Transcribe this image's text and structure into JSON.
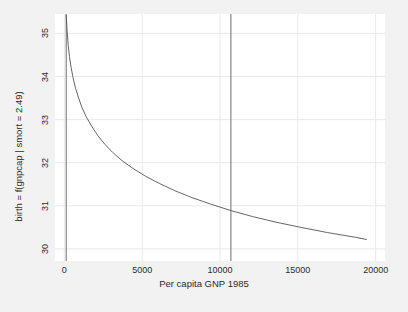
{
  "chart_data": {
    "type": "line",
    "title": "",
    "xlabel": "Per capita GNP 1985",
    "ylabel": "birth = f(gnpcap | smort = 2.49)",
    "xlim": [
      -600,
      20600
    ],
    "ylim": [
      29.72,
      35.45
    ],
    "xticks": [
      0,
      5000,
      10000,
      15000,
      20000
    ],
    "xticklabels": [
      "0",
      "5000",
      "10000",
      "15000",
      "20000"
    ],
    "yticks": [
      30,
      31,
      32,
      33,
      34,
      35
    ],
    "yticklabels": [
      "30",
      "31",
      "32",
      "33",
      "34",
      "35"
    ],
    "grid": true,
    "legend": null,
    "background": "#f2f2f2",
    "panel_background": "#ffffff",
    "grid_color": "#e9e9e9",
    "line_color": "#555555",
    "vline_color": "#6e6e6e",
    "vlines": [
      {
        "x": 120,
        "label": "gnpcap-lower-reference"
      },
      {
        "x": 10700,
        "label": "gnpcap-upper-reference"
      }
    ],
    "series": [
      {
        "name": "birth-conditional-effect",
        "x": [
          120,
          180,
          250,
          330,
          430,
          560,
          720,
          900,
          1120,
          1400,
          1750,
          2150,
          2600,
          3100,
          3700,
          4400,
          5200,
          6100,
          7100,
          8200,
          9400,
          10700,
          12100,
          13600,
          15200,
          16900,
          18700,
          19400
        ],
        "y": [
          35.42,
          35.05,
          34.72,
          34.46,
          34.22,
          33.97,
          33.73,
          33.52,
          33.29,
          33.07,
          32.85,
          32.63,
          32.43,
          32.24,
          32.05,
          31.87,
          31.69,
          31.52,
          31.35,
          31.19,
          31.04,
          30.89,
          30.75,
          30.62,
          30.5,
          30.38,
          30.27,
          30.22
        ]
      }
    ]
  }
}
